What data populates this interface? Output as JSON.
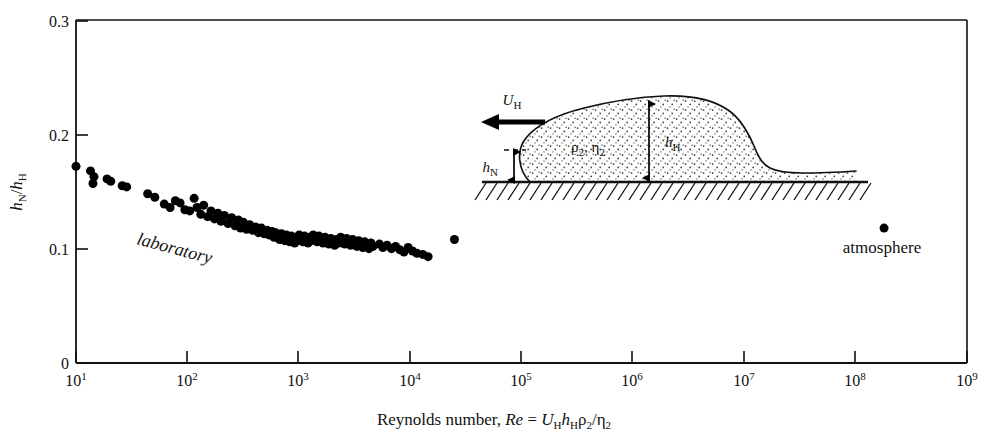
{
  "chart_data": {
    "type": "scatter",
    "title": "",
    "xlabel": "Reynolds number, Re = U_H h_H ρ₂/η₂",
    "ylabel": "h_N/h_H",
    "xscale": "log",
    "xlim": [
      10,
      1000000000
    ],
    "ylim": [
      0,
      0.3
    ],
    "grid": false,
    "legend": "none",
    "xticks": [
      {
        "value": 10,
        "label": "10",
        "exp": "1"
      },
      {
        "value": 100,
        "label": "10",
        "exp": "2"
      },
      {
        "value": 1000,
        "label": "10",
        "exp": "3"
      },
      {
        "value": 10000,
        "label": "10",
        "exp": "4"
      },
      {
        "value": 100000,
        "label": "10",
        "exp": "5"
      },
      {
        "value": 1000000,
        "label": "10",
        "exp": "6"
      },
      {
        "value": 10000000,
        "label": "10",
        "exp": "7"
      },
      {
        "value": 100000000,
        "label": "10",
        "exp": "8"
      },
      {
        "value": 1000000000,
        "label": "10",
        "exp": "9"
      }
    ],
    "yticks": [
      {
        "value": 0,
        "label": "0"
      },
      {
        "value": 0.1,
        "label": "0.1"
      },
      {
        "value": 0.2,
        "label": "0.2"
      },
      {
        "value": 0.3,
        "label": "0.3"
      }
    ],
    "marker": {
      "shape": "circle",
      "color": "#000000",
      "size_px": 9
    },
    "series": [
      {
        "name": "laboratory",
        "annotation": "laboratory",
        "points": [
          [
            10,
            0.172
          ],
          [
            13.5,
            0.168
          ],
          [
            14.5,
            0.163
          ],
          [
            14.2,
            0.157
          ],
          [
            19,
            0.161
          ],
          [
            20.5,
            0.159
          ],
          [
            26,
            0.155
          ],
          [
            28.5,
            0.154
          ],
          [
            44,
            0.148
          ],
          [
            51,
            0.145
          ],
          [
            62,
            0.139
          ],
          [
            70,
            0.136
          ],
          [
            78,
            0.142
          ],
          [
            86,
            0.14
          ],
          [
            95,
            0.134
          ],
          [
            105,
            0.133
          ],
          [
            115,
            0.144
          ],
          [
            122,
            0.136
          ],
          [
            132,
            0.13
          ],
          [
            140,
            0.138
          ],
          [
            152,
            0.128
          ],
          [
            163,
            0.133
          ],
          [
            175,
            0.126
          ],
          [
            188,
            0.131
          ],
          [
            200,
            0.124
          ],
          [
            215,
            0.129
          ],
          [
            232,
            0.122
          ],
          [
            250,
            0.127
          ],
          [
            268,
            0.12
          ],
          [
            288,
            0.125
          ],
          [
            300,
            0.118
          ],
          [
            318,
            0.123
          ],
          [
            340,
            0.117
          ],
          [
            362,
            0.121
          ],
          [
            385,
            0.116
          ],
          [
            410,
            0.119
          ],
          [
            435,
            0.114
          ],
          [
            462,
            0.118
          ],
          [
            490,
            0.113
          ],
          [
            520,
            0.116
          ],
          [
            545,
            0.112
          ],
          [
            575,
            0.115
          ],
          [
            600,
            0.11
          ],
          [
            620,
            0.114
          ],
          [
            650,
            0.112
          ],
          [
            672,
            0.108
          ],
          [
            700,
            0.113
          ],
          [
            725,
            0.11
          ],
          [
            750,
            0.107
          ],
          [
            775,
            0.112
          ],
          [
            800,
            0.109
          ],
          [
            830,
            0.106
          ],
          [
            860,
            0.111
          ],
          [
            890,
            0.108
          ],
          [
            920,
            0.105
          ],
          [
            950,
            0.11
          ],
          [
            980,
            0.107
          ],
          [
            1010,
            0.112
          ],
          [
            1050,
            0.109
          ],
          [
            1090,
            0.106
          ],
          [
            1130,
            0.111
          ],
          [
            1170,
            0.108
          ],
          [
            1210,
            0.105
          ],
          [
            1250,
            0.11
          ],
          [
            1300,
            0.107
          ],
          [
            1350,
            0.112
          ],
          [
            1400,
            0.109
          ],
          [
            1460,
            0.106
          ],
          [
            1520,
            0.111
          ],
          [
            1580,
            0.108
          ],
          [
            1650,
            0.105
          ],
          [
            1720,
            0.11
          ],
          [
            1790,
            0.107
          ],
          [
            1860,
            0.104
          ],
          [
            1940,
            0.109
          ],
          [
            2020,
            0.106
          ],
          [
            2100,
            0.103
          ],
          [
            2190,
            0.108
          ],
          [
            2280,
            0.105
          ],
          [
            2380,
            0.11
          ],
          [
            2480,
            0.107
          ],
          [
            2580,
            0.104
          ],
          [
            2690,
            0.109
          ],
          [
            2800,
            0.106
          ],
          [
            2920,
            0.103
          ],
          [
            3050,
            0.108
          ],
          [
            3180,
            0.105
          ],
          [
            3320,
            0.102
          ],
          [
            3460,
            0.107
          ],
          [
            3610,
            0.104
          ],
          [
            3760,
            0.101
          ],
          [
            3920,
            0.106
          ],
          [
            4090,
            0.103
          ],
          [
            4270,
            0.1
          ],
          [
            4450,
            0.105
          ],
          [
            4640,
            0.102
          ],
          [
            5300,
            0.104
          ],
          [
            5700,
            0.101
          ],
          [
            6200,
            0.103
          ],
          [
            6800,
            0.1
          ],
          [
            7400,
            0.102
          ],
          [
            8100,
            0.099
          ],
          [
            8800,
            0.097
          ],
          [
            9600,
            0.101
          ],
          [
            10500,
            0.098
          ],
          [
            11500,
            0.096
          ],
          [
            13000,
            0.095
          ],
          [
            14500,
            0.093
          ],
          [
            25000,
            0.108
          ]
        ]
      },
      {
        "name": "atmosphere",
        "annotation": "atmosphere",
        "points": [
          [
            180000000,
            0.118
          ]
        ]
      }
    ],
    "annotations": [
      {
        "text": "laboratory",
        "x": 450,
        "y": 0.098,
        "style": "italic",
        "rotation": 15
      },
      {
        "text": "atmosphere",
        "x": 180000000,
        "y": 0.082,
        "style": "normal",
        "rotation": 0
      }
    ]
  },
  "axes": {
    "y_label_parts": {
      "h1": "h",
      "sub1": "N",
      "slash": "/",
      "h2": "h",
      "sub2": "H"
    },
    "x_label_parts": {
      "prefix": "Reynolds number, ",
      "re": "Re",
      "equals": " = ",
      "u": "U",
      "u_sub": "H",
      "hh": "h",
      "hh_sub": "H",
      "rho": "ρ",
      "rho_sub": "2",
      "div": "/",
      "eta": "η",
      "eta_sub": "2"
    }
  },
  "inset": {
    "name": "gravity-current-head-diagram",
    "velocity_label": {
      "symbol": "U",
      "subscript": "H"
    },
    "density_label": {
      "rho": "ρ",
      "rho_sub": "2",
      "comma": ", ",
      "eta": "η",
      "eta_sub": "2"
    },
    "head_height_label": {
      "symbol": "h",
      "subscript": "H"
    },
    "nose_height_label": {
      "symbol": "h",
      "subscript": "N"
    },
    "fill_pattern": "stipple",
    "ground_pattern": "hatched",
    "arrow_direction": "left"
  }
}
